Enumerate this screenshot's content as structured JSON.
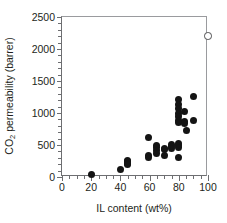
{
  "chart_data": {
    "type": "scatter",
    "title": "",
    "xlabel": "IL content (wt%)",
    "ylabel": "CO2 permeability (barrer)",
    "ylabel_parts": {
      "pre": "CO",
      "sub": "2",
      "post": " permeability (barrer)"
    },
    "xlim": [
      0,
      100
    ],
    "ylim": [
      0,
      2500
    ],
    "xticks": [
      0,
      20,
      40,
      60,
      80,
      100
    ],
    "yticks": [
      0,
      500,
      1000,
      1500,
      2000,
      2500
    ],
    "xtick_labels": [
      "0",
      "20",
      "40",
      "60",
      "80",
      "100"
    ],
    "ytick_labels": [
      "0",
      "500",
      "1000",
      "1500",
      "2000",
      "2500"
    ],
    "x_minor_tick_step": 5,
    "y_minor_tick_step": 100,
    "grid": false,
    "legend": false,
    "series": [
      {
        "name": "IL-polymer composite membranes",
        "marker": "filled-circle",
        "color": "#141414",
        "points": [
          [
            20,
            40
          ],
          [
            40,
            115
          ],
          [
            45,
            260
          ],
          [
            45,
            235
          ],
          [
            45,
            210
          ],
          [
            45,
            190
          ],
          [
            59,
            610
          ],
          [
            59,
            340
          ],
          [
            59,
            310
          ],
          [
            65,
            490
          ],
          [
            65,
            455
          ],
          [
            65,
            420
          ],
          [
            65,
            370
          ],
          [
            70,
            450
          ],
          [
            70,
            435
          ],
          [
            70,
            335
          ],
          [
            75,
            505
          ],
          [
            75,
            480
          ],
          [
            75,
            440
          ],
          [
            80,
            1205
          ],
          [
            80,
            1140
          ],
          [
            80,
            1070
          ],
          [
            80,
            995
          ],
          [
            80,
            940
          ],
          [
            80,
            880
          ],
          [
            80,
            850
          ],
          [
            80,
            520
          ],
          [
            80,
            490
          ],
          [
            80,
            455
          ],
          [
            80,
            305
          ],
          [
            84,
            1025
          ],
          [
            84,
            870
          ],
          [
            84,
            830
          ],
          [
            85,
            720
          ],
          [
            90,
            1255
          ],
          [
            90,
            880
          ]
        ]
      },
      {
        "name": "Neat ionic liquid",
        "marker": "open-circle",
        "color": "#4d4d4f",
        "points": [
          [
            100,
            2200
          ]
        ]
      }
    ]
  }
}
